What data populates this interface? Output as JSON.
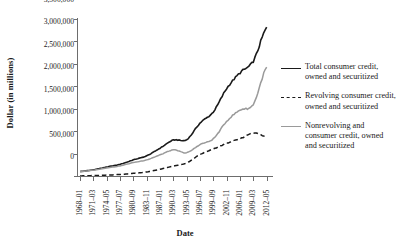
{
  "chart_data": {
    "type": "line",
    "title": "",
    "xlabel": "Date",
    "ylabel": "Dollar (in millions)",
    "ylim": [
      0,
      3500000
    ],
    "ytick_labels": [
      "3,500,000",
      "3,000,000",
      "2,500,000",
      "2,000,000",
      "1,500,000",
      "1,000,000",
      "500,000",
      "0"
    ],
    "ytick_values": [
      3500000,
      3000000,
      2500000,
      2000000,
      1500000,
      1000000,
      500000,
      0
    ],
    "grid": false,
    "legend_position": "right",
    "xtick_labels": [
      "1968–01",
      "1971–03",
      "1974–05",
      "1977–07",
      "1980–09",
      "1983–11",
      "1987–01",
      "1990–03",
      "1993–05",
      "1996–07",
      "1999–09",
      "2002–11",
      "2006–01",
      "2009–03",
      "2012–05"
    ],
    "series": [
      {
        "name": "Total consumer credit, owned and securitized",
        "color": "#1a1a1a",
        "style": "solid",
        "x": [
          "1968-01",
          "1971-03",
          "1974-05",
          "1977-07",
          "1980-09",
          "1983-11",
          "1987-01",
          "1990-03",
          "1993-05",
          "1996-07",
          "1999-09",
          "2002-11",
          "2006-01",
          "2009-03",
          "2012-05"
        ],
        "values": [
          100000,
          140000,
          200000,
          260000,
          360000,
          450000,
          620000,
          800000,
          810000,
          1180000,
          1430000,
          1950000,
          2300000,
          2560000,
          3300000
        ]
      },
      {
        "name": "Revolving consumer credit, owned and securitized",
        "color": "#1a1a1a",
        "style": "dashed",
        "x": [
          "1968-01",
          "1971-03",
          "1974-05",
          "1977-07",
          "1980-09",
          "1983-11",
          "1987-01",
          "1990-03",
          "1993-05",
          "1996-07",
          "1999-09",
          "2002-11",
          "2006-01",
          "2009-03",
          "2012-05"
        ],
        "values": [
          2000,
          10000,
          20000,
          35000,
          60000,
          90000,
          150000,
          220000,
          290000,
          480000,
          600000,
          730000,
          830000,
          960000,
          870000
        ]
      },
      {
        "name": "Nonrevolving and consumer credit, owned and securitized",
        "color": "#9a9a9a",
        "style": "solid",
        "x": [
          "1968-01",
          "1971-03",
          "1974-05",
          "1977-07",
          "1980-09",
          "1983-11",
          "1987-01",
          "1990-03",
          "1993-05",
          "1996-07",
          "1999-09",
          "2002-11",
          "2006-01",
          "2009-03",
          "2012-05"
        ],
        "values": [
          98000,
          130000,
          180000,
          225000,
          300000,
          360000,
          470000,
          580000,
          520000,
          700000,
          830000,
          1220000,
          1470000,
          1600000,
          2420000
        ]
      }
    ]
  }
}
